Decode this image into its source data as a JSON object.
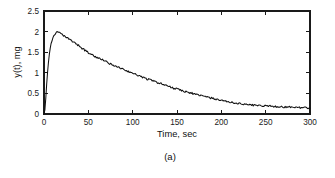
{
  "figure": {
    "caption": "(a)",
    "background_color": "#ffffff",
    "line_color": "#111111",
    "axis_color": "#1a1a1a"
  },
  "chart_data": {
    "type": "line",
    "title": "",
    "subtitle": "",
    "xlabel": "Time, sec",
    "ylabel": "y(t), mg",
    "xlim": [
      0,
      300
    ],
    "ylim": [
      0,
      2.5
    ],
    "xticks": [
      0,
      50,
      100,
      150,
      200,
      250,
      300
    ],
    "xticklabels": [
      "0",
      "50",
      "100",
      "150",
      "200",
      "250",
      "300"
    ],
    "yticks": [
      0,
      0.5,
      1,
      1.5,
      2,
      2.5
    ],
    "yticklabels": [
      "0",
      "0.5",
      "1",
      "1.5",
      "2",
      "2.5"
    ],
    "grid": false,
    "legend": null,
    "legend_position": "none",
    "annotations": [],
    "series": [
      {
        "name": "y(t)",
        "color": "#111111",
        "x": [
          0,
          1,
          2,
          3,
          4,
          5,
          6,
          7,
          8,
          9,
          10,
          11,
          12,
          13,
          14,
          15,
          16,
          17,
          18,
          19,
          20,
          22,
          24,
          26,
          28,
          30,
          32,
          34,
          36,
          38,
          40,
          42,
          44,
          46,
          48,
          50,
          54,
          58,
          62,
          66,
          70,
          74,
          78,
          82,
          86,
          90,
          94,
          98,
          102,
          106,
          110,
          114,
          118,
          122,
          126,
          130,
          134,
          138,
          142,
          146,
          150,
          154,
          158,
          162,
          166,
          170,
          174,
          178,
          182,
          186,
          190,
          194,
          198,
          202,
          206,
          210,
          214,
          218,
          222,
          226,
          230,
          234,
          238,
          242,
          246,
          250,
          254,
          258,
          262,
          266,
          270,
          274,
          278,
          282,
          286,
          290,
          294,
          298,
          300
        ],
        "y": [
          0.0,
          0.1,
          0.38,
          0.72,
          1.02,
          1.27,
          1.46,
          1.6,
          1.71,
          1.79,
          1.85,
          1.89,
          1.93,
          1.95,
          1.97,
          1.99,
          1.97,
          1.99,
          1.96,
          1.94,
          1.93,
          1.9,
          1.87,
          1.85,
          1.82,
          1.79,
          1.76,
          1.74,
          1.7,
          1.68,
          1.64,
          1.61,
          1.58,
          1.55,
          1.52,
          1.49,
          1.44,
          1.39,
          1.35,
          1.31,
          1.27,
          1.22,
          1.19,
          1.15,
          1.11,
          1.08,
          1.04,
          1.01,
          0.97,
          0.94,
          0.9,
          0.87,
          0.84,
          0.81,
          0.78,
          0.75,
          0.72,
          0.69,
          0.66,
          0.63,
          0.61,
          0.58,
          0.55,
          0.53,
          0.51,
          0.48,
          0.46,
          0.44,
          0.42,
          0.4,
          0.38,
          0.36,
          0.34,
          0.32,
          0.3,
          0.29,
          0.27,
          0.26,
          0.25,
          0.24,
          0.23,
          0.22,
          0.21,
          0.21,
          0.2,
          0.2,
          0.19,
          0.19,
          0.18,
          0.18,
          0.17,
          0.17,
          0.17,
          0.16,
          0.16,
          0.15,
          0.15,
          0.15,
          0.14
        ],
        "noise_amplitude": 0.022,
        "description": "Sharp rise from zero to a peak of about 2.0 mg near t = 15 s, followed by a noisy monotonic decay toward about 0.15 mg at t = 300 s."
      }
    ]
  }
}
